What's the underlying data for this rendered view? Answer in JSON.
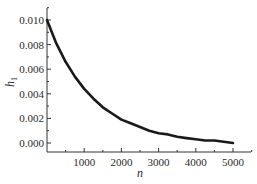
{
  "chart_data": {
    "type": "line",
    "title": "",
    "xlabel": "n",
    "ylabel": "h",
    "ylabel_subscript": "1",
    "xlim": [
      0,
      5500
    ],
    "ylim": [
      -0.001,
      0.0115
    ],
    "x_ticks": [
      1000,
      2000,
      3000,
      4000,
      5000
    ],
    "x_tick_labels": [
      "1000",
      "2000",
      "3000",
      "4000",
      "5000"
    ],
    "y_ticks": [
      0.0,
      0.002,
      0.004,
      0.006,
      0.008,
      0.01
    ],
    "y_tick_labels": [
      "0.000",
      "0.002",
      "0.004",
      "0.006",
      "0.008",
      "0.010"
    ],
    "grid": false,
    "legend": null,
    "series": [
      {
        "name": "h1",
        "color": "#1a1a1a",
        "x": [
          0,
          250,
          500,
          750,
          1000,
          1250,
          1500,
          1750,
          2000,
          2250,
          2500,
          2750,
          3000,
          3250,
          3500,
          3750,
          4000,
          4250,
          4500,
          4750,
          5000
        ],
        "values": [
          0.01,
          0.0081,
          0.0066,
          0.0054,
          0.0044,
          0.0036,
          0.0029,
          0.0024,
          0.0019,
          0.0016,
          0.0013,
          0.001,
          0.0008,
          0.0007,
          0.0005,
          0.0004,
          0.0003,
          0.0002,
          0.0002,
          0.0001,
          0.0
        ]
      }
    ]
  }
}
